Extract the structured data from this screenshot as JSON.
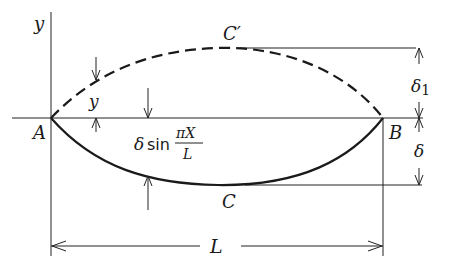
{
  "figure": {
    "type": "beam deflection diagram",
    "labels": {
      "y_axis": "y",
      "point_a": "A",
      "point_b": "B",
      "point_c": "C",
      "point_c_prime": "C′",
      "ordinate_y": "y",
      "length": "L",
      "delta": "δ",
      "delta1_symbol": "δ",
      "delta1_subscript": "1",
      "formula_prefix": "δ",
      "formula_sin": "sin",
      "formula_numerator": "πX",
      "formula_denominator": "L"
    },
    "curves": [
      {
        "name": "initial-deflected-shape",
        "style": "dashed",
        "from": "A",
        "through": "C′",
        "to": "B"
      },
      {
        "name": "sine-deflected-shape",
        "style": "solid",
        "from": "A",
        "through": "C",
        "to": "B",
        "equation": "δ sin(πX/L)"
      }
    ]
  }
}
